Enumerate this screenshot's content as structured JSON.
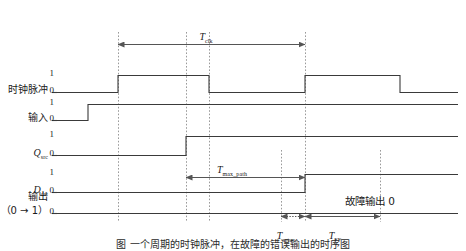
{
  "figure": {
    "type": "timing-diagram",
    "width": 466,
    "height": 251,
    "background": "#ffffff",
    "wave_color": "#3a3a3a",
    "guide_color": "#9a9a9a",
    "arrow_color": "#555555"
  },
  "signals": [
    {
      "id": "clock",
      "label": "时钟脉冲",
      "high_label": "1",
      "low_label": "0",
      "baseline_y": 92,
      "top_y": 75,
      "transitions": [
        {
          "x": 118,
          "to": 1
        },
        {
          "x": 209,
          "to": 0
        },
        {
          "x": 305,
          "to": 1
        },
        {
          "x": 400,
          "to": 0
        }
      ],
      "start_level": 0,
      "start_x": 57,
      "end_x": 458
    },
    {
      "id": "input",
      "label": "输入",
      "high_label": "1",
      "low_label": "0",
      "baseline_y": 120,
      "top_y": 104,
      "transitions": [
        {
          "x": 88,
          "to": 1
        }
      ],
      "start_level": 0,
      "start_x": 57,
      "end_x": 458
    },
    {
      "id": "q-src",
      "label": "Q",
      "label_sub": "src",
      "high_label": "1",
      "low_label": "0",
      "baseline_y": 155,
      "top_y": 136,
      "transitions": [
        {
          "x": 186,
          "to": 1
        }
      ],
      "start_level": 0,
      "start_x": 57,
      "end_x": 458
    },
    {
      "id": "d-dst",
      "label": "D",
      "label_sub": "dst",
      "high_label": "1",
      "low_label": "0",
      "baseline_y": 192,
      "top_y": 174,
      "transitions": [
        {
          "x": 305,
          "to": 1
        }
      ],
      "start_level": 0,
      "start_x": 57,
      "end_x": 458
    },
    {
      "id": "output",
      "label": "输出",
      "label2": "（0 → 1）",
      "low_label": "0",
      "baseline_y": 213,
      "top_y": 213,
      "transitions": [],
      "start_level": 0,
      "start_x": 57,
      "end_x": 458
    }
  ],
  "guides": [
    {
      "x": 118,
      "y1": 32,
      "y2": 222
    },
    {
      "x": 186,
      "y1": 32,
      "y2": 222
    },
    {
      "x": 209,
      "y1": 32,
      "y2": 222
    },
    {
      "x": 281,
      "y1": 150,
      "y2": 222
    },
    {
      "x": 305,
      "y1": 32,
      "y2": 222
    },
    {
      "x": 380,
      "y1": 150,
      "y2": 222
    }
  ],
  "measures": [
    {
      "id": "t-clk",
      "name": "T",
      "sub": "clk",
      "x1": 118,
      "x2": 305,
      "y": 44,
      "label_x": 206,
      "label_y": 27,
      "style": "solid",
      "arrows": "both"
    },
    {
      "id": "t-max-path",
      "name": "T",
      "sub": "max_path",
      "x1": 186,
      "x2": 305,
      "y": 177,
      "label_x": 232,
      "label_y": 160,
      "style": "solid",
      "arrows": "both"
    },
    {
      "id": "t-setup",
      "name": "T",
      "sub": "setup",
      "x1": 281,
      "x2": 305,
      "y": 216,
      "label_x": 286,
      "label_y": 226,
      "style": "dotted",
      "arrows": "both"
    },
    {
      "id": "t-ff",
      "name": "T",
      "sub": "FF",
      "x1": 305,
      "x2": 380,
      "y": 216,
      "label_x": 335,
      "label_y": 226,
      "style": "solid",
      "arrows": "both"
    }
  ],
  "annotations": [
    {
      "id": "fault-output",
      "text": "故障输出 0",
      "x": 370,
      "y": 196
    }
  ],
  "caption": {
    "text": "图    一个周期的时钟脉冲，在故障的错误输出的时序图"
  }
}
